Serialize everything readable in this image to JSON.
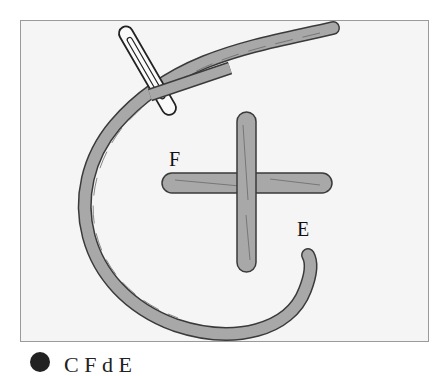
{
  "diagram": {
    "labels": {
      "point_f": "F",
      "point_e": "E"
    },
    "caption": "C              F     d       E",
    "colors": {
      "thread": "#a8a8a8",
      "outline": "#3a3a3a",
      "background": "#f5f5f5",
      "frame": "#9a9a9a"
    }
  }
}
